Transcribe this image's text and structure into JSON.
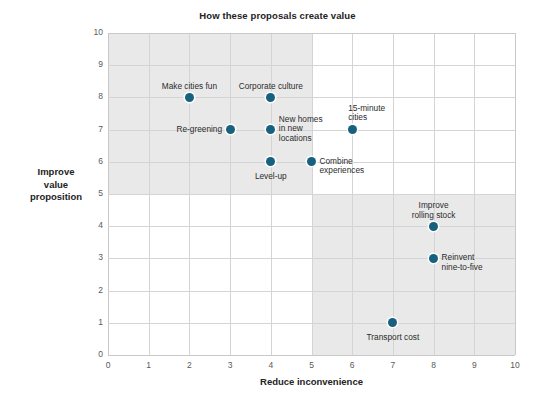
{
  "chart_data": {
    "type": "scatter",
    "title": "How these proposals create value",
    "xlabel": "Reduce inconvenience",
    "ylabel": "Improve value proposition",
    "ylabel_lines": [
      "Improve",
      "value",
      "proposition"
    ],
    "xlim": [
      0,
      10
    ],
    "ylim": [
      0,
      10
    ],
    "xticks": [
      "0",
      "1",
      "2",
      "3",
      "4",
      "5",
      "6",
      "7",
      "8",
      "9",
      "10"
    ],
    "yticks": [
      "0",
      "1",
      "2",
      "3",
      "4",
      "5",
      "6",
      "7",
      "8",
      "9",
      "10"
    ],
    "grid": true,
    "legend": "none",
    "marker_color": "#17617f",
    "shaded_quadrants": [
      {
        "name": "upper-left",
        "x_range": [
          0,
          5
        ],
        "y_range": [
          5,
          10
        ],
        "color": "#e9e9e9"
      },
      {
        "name": "lower-right",
        "x_range": [
          5,
          10
        ],
        "y_range": [
          0,
          5
        ],
        "color": "#e9e9e9"
      }
    ],
    "points": [
      {
        "label": "Make cities fun",
        "x": 2,
        "y": 8,
        "label_anchor": "center",
        "label_dx": 0,
        "label_dy": -15
      },
      {
        "label": "Corporate culture",
        "x": 4,
        "y": 8,
        "label_anchor": "center",
        "label_dx": 0,
        "label_dy": -15
      },
      {
        "label": "Re-greening",
        "x": 3,
        "y": 7,
        "label_anchor": "right",
        "label_dx": -8,
        "label_dy": -5
      },
      {
        "label": "New homes\nin new\nlocations",
        "x": 4,
        "y": 7,
        "label_anchor": "left",
        "label_dx": 8,
        "label_dy": -15
      },
      {
        "label": "15-minute\ncities",
        "x": 6,
        "y": 7,
        "label_anchor": "left",
        "label_dx": -4,
        "label_dy": -26
      },
      {
        "label": "Level-up",
        "x": 4,
        "y": 6,
        "label_anchor": "center",
        "label_dx": 0,
        "label_dy": 10
      },
      {
        "label": "Combine\nexperiences",
        "x": 5,
        "y": 6,
        "label_anchor": "left",
        "label_dx": 8,
        "label_dy": -5
      },
      {
        "label": "Improve\nrolling stock",
        "x": 8,
        "y": 4,
        "label_anchor": "center",
        "label_dx": 0,
        "label_dy": -25
      },
      {
        "label": "Reinvent\nnine-to-five",
        "x": 8,
        "y": 3,
        "label_anchor": "left",
        "label_dx": 8,
        "label_dy": -5
      },
      {
        "label": "Transport cost",
        "x": 7,
        "y": 1,
        "label_anchor": "center",
        "label_dx": 0,
        "label_dy": 10
      }
    ]
  }
}
